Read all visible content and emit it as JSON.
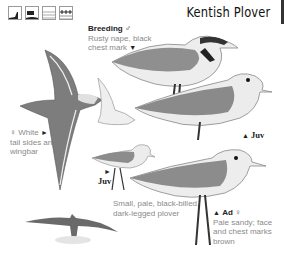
{
  "header": {
    "title": "Kentish Plover",
    "habitat_icons": [
      "coast-icon",
      "estuary-icon",
      "marsh-icon",
      "wetland-icon"
    ]
  },
  "labels": {
    "breeding": {
      "heading": "Breeding",
      "symbol": "♂",
      "text_line1": "Rusty nape, black",
      "text_line2": "chest mark",
      "pointer": "▼"
    },
    "female_flight": {
      "symbol": "♀",
      "heading": "White",
      "pointer": "►",
      "text_line1": "tail sides and",
      "text_line2": "wingbar"
    },
    "juv_standing": {
      "pointer": "▲",
      "text": "Juv"
    },
    "juv_small": {
      "pointer": "►",
      "text": "Juv"
    },
    "description": {
      "line1": "Small, pale, black-billed,",
      "line2": "dark-legged plover"
    },
    "adult_female": {
      "pointer": "▲",
      "heading": "Ad",
      "symbol": "♀",
      "line1": "Pale sandy; face",
      "line2": "and chest marks",
      "line3": "brown"
    }
  },
  "colors": {
    "text_gray": "#8a8a8a",
    "text_dark": "#222222",
    "bird_gray": "#8c8c8c",
    "bird_light": "#e8e8e8"
  }
}
